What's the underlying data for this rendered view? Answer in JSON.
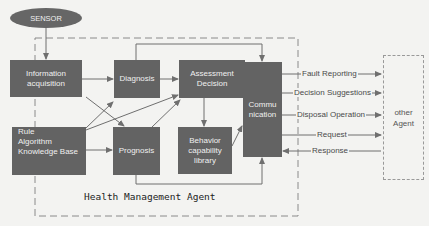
{
  "diagram": {
    "title": "Health Management Agent",
    "colors": {
      "box_fill": "#636363",
      "box_text": "#f0f0f0",
      "arrow": "#6f6f6f",
      "dashed_border": "#8a8a8a",
      "background": "#f3f3f1"
    },
    "nodes": {
      "sensor": {
        "label": "SENSOR",
        "shape": "ellipse"
      },
      "info_acq": {
        "line1": "Information",
        "line2": "acquisition"
      },
      "diagnosis": {
        "label": "Diagnosis"
      },
      "assessment": {
        "line1": "Assessment",
        "line2": "Decision"
      },
      "communication": {
        "line1": "Commu",
        "line2": "nication"
      },
      "rule_base": {
        "line1": "Rule",
        "line2": "Algorithm",
        "line3": "Knowledge Base"
      },
      "prognosis": {
        "label": "Prognosis"
      },
      "behavior": {
        "line1": "Behavior",
        "line2": "capability",
        "line3": "library"
      },
      "other_agent": {
        "line1": "other",
        "line2": "Agent",
        "shape": "dashed-box"
      }
    },
    "messages": [
      {
        "label": "Fault Reporting",
        "direction": "to-other-agent"
      },
      {
        "label": "Decision Suggestions",
        "direction": "to-other-agent"
      },
      {
        "label": "Disposal Operation",
        "direction": "to-other-agent"
      },
      {
        "label": "Request",
        "direction": "to-other-agent"
      },
      {
        "label": "Response",
        "direction": "to-communication"
      }
    ],
    "edges": [
      {
        "from": "SENSOR",
        "to": "Information acquisition"
      },
      {
        "from": "Information acquisition",
        "to": "Diagnosis"
      },
      {
        "from": "Information acquisition",
        "to": "Prognosis"
      },
      {
        "from": "Rule Algorithm Knowledge Base",
        "to": "Diagnosis"
      },
      {
        "from": "Rule Algorithm Knowledge Base",
        "to": "Assessment Decision"
      },
      {
        "from": "Rule Algorithm Knowledge Base",
        "to": "Prognosis"
      },
      {
        "from": "Diagnosis",
        "to": "Assessment Decision"
      },
      {
        "from": "Diagnosis",
        "to": "Communication"
      },
      {
        "from": "Prognosis",
        "to": "Assessment Decision"
      },
      {
        "from": "Prognosis",
        "to": "Communication"
      },
      {
        "from": "Assessment Decision",
        "to": "Communication"
      },
      {
        "from": "Assessment Decision",
        "to": "Behavior capability library"
      },
      {
        "from": "Behavior capability library",
        "to": "Communication"
      }
    ]
  }
}
